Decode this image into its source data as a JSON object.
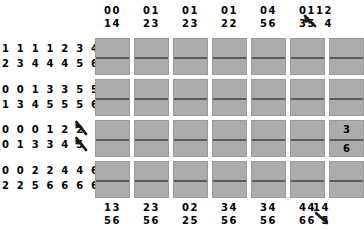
{
  "diagram": {
    "type": "paired-digit-matrix",
    "rows": 4,
    "columns": 7,
    "cell_fill_color": "#acacac",
    "divider_color": "#5a5a5a",
    "background_color": "#ffffff"
  },
  "top_headers": [
    {
      "line1": "00",
      "line2": "14"
    },
    {
      "line1": "01",
      "line2": "23"
    },
    {
      "line1": "01",
      "line2": "23"
    },
    {
      "line1": "01",
      "line2": "22"
    },
    {
      "line1": "04",
      "line2": "56"
    },
    {
      "line1": "01",
      "line2": "35"
    },
    {
      "line1": "12",
      "line2": "4"
    }
  ],
  "bottom_headers": [
    {
      "line1": "13",
      "line2": "56"
    },
    {
      "line1": "23",
      "line2": "56"
    },
    {
      "line1": "02",
      "line2": "25"
    },
    {
      "line1": "34",
      "line2": "56"
    },
    {
      "line1": "34",
      "line2": "56"
    },
    {
      "line1": "44",
      "line2": "66"
    },
    {
      "line1": "14",
      "line2": "5"
    }
  ],
  "row_headers": [
    {
      "line1": "1 1 1 1 2 3 4",
      "line2": "2 3 4 4 4 5 6"
    },
    {
      "line1": "0 0 1 3 3 5 5",
      "line2": "1 3 4 5 5 5 6"
    },
    {
      "line1": "0 0 0 1 2 2",
      "line2": "0 1 3 3 4 5"
    },
    {
      "line1": "0 0 2 2 4 4 6",
      "line2": "2 2 5 6 6 6 6"
    }
  ],
  "cells": [
    [
      {
        "top": "",
        "bottom": ""
      },
      {
        "top": "",
        "bottom": ""
      },
      {
        "top": "",
        "bottom": ""
      },
      {
        "top": "",
        "bottom": ""
      },
      {
        "top": "",
        "bottom": ""
      },
      {
        "top": "",
        "bottom": ""
      },
      {
        "top": "",
        "bottom": ""
      }
    ],
    [
      {
        "top": "",
        "bottom": ""
      },
      {
        "top": "",
        "bottom": ""
      },
      {
        "top": "",
        "bottom": ""
      },
      {
        "top": "",
        "bottom": ""
      },
      {
        "top": "",
        "bottom": ""
      },
      {
        "top": "",
        "bottom": ""
      },
      {
        "top": "",
        "bottom": ""
      }
    ],
    [
      {
        "top": "",
        "bottom": ""
      },
      {
        "top": "",
        "bottom": ""
      },
      {
        "top": "",
        "bottom": ""
      },
      {
        "top": "",
        "bottom": ""
      },
      {
        "top": "",
        "bottom": ""
      },
      {
        "top": "",
        "bottom": ""
      },
      {
        "top": "3",
        "bottom": "6"
      }
    ],
    [
      {
        "top": "",
        "bottom": ""
      },
      {
        "top": "",
        "bottom": ""
      },
      {
        "top": "",
        "bottom": ""
      },
      {
        "top": "",
        "bottom": ""
      },
      {
        "top": "",
        "bottom": ""
      },
      {
        "top": "",
        "bottom": ""
      },
      {
        "top": "",
        "bottom": ""
      }
    ]
  ],
  "marks": [
    {
      "name": "cursor-mark-top-right"
    },
    {
      "name": "cursor-mark-row3-upper"
    },
    {
      "name": "cursor-mark-row3-lower"
    },
    {
      "name": "cursor-mark-bottom-right"
    }
  ]
}
